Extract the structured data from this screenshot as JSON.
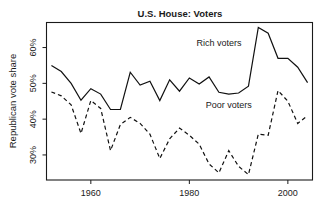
{
  "chart_data": {
    "type": "line",
    "title": "U.S. House: Voters",
    "xlabel": "",
    "ylabel": "Republican vote share",
    "xlim": [
      1951,
      2005
    ],
    "ylim": [
      23,
      67
    ],
    "grid": false,
    "legend_position": "inline-annotations",
    "xticks": [
      1960,
      1980,
      2000
    ],
    "xtick_labels": [
      "1960",
      "1980",
      "2000"
    ],
    "yticks": [
      30,
      40,
      50,
      60
    ],
    "ytick_labels": [
      "30%",
      "40%",
      "50%",
      "60%"
    ],
    "annotations": [
      {
        "text": "Rich voters",
        "x": 1986,
        "y": 60.5
      },
      {
        "text": "Poor voters",
        "x": 1988,
        "y": 43.0
      }
    ],
    "series": [
      {
        "name": "Rich voters",
        "style": "solid",
        "color": "#111111",
        "x": [
          1952,
          1954,
          1956,
          1958,
          1960,
          1962,
          1964,
          1966,
          1968,
          1970,
          1972,
          1974,
          1976,
          1978,
          1980,
          1982,
          1984,
          1986,
          1988,
          1990,
          1992,
          1994,
          1996,
          1998,
          2000,
          2002,
          2004
        ],
        "values": [
          55.0,
          53.3,
          50.0,
          45.3,
          48.5,
          47.0,
          42.7,
          42.7,
          53.1,
          49.5,
          50.6,
          45.2,
          51.0,
          47.8,
          51.5,
          49.8,
          51.8,
          47.5,
          47.0,
          47.3,
          49.2,
          65.6,
          64.0,
          57.0,
          57.0,
          54.5,
          50.2
        ]
      },
      {
        "name": "Poor voters",
        "style": "dashed",
        "color": "#111111",
        "x": [
          1952,
          1954,
          1956,
          1958,
          1960,
          1962,
          1964,
          1966,
          1968,
          1970,
          1972,
          1974,
          1976,
          1978,
          1980,
          1982,
          1984,
          1986,
          1988,
          1990,
          1992,
          1994,
          1996,
          1998,
          2000,
          2002,
          2004
        ],
        "values": [
          47.6,
          46.5,
          44.0,
          36.0,
          45.2,
          43.0,
          31.2,
          38.5,
          40.5,
          38.8,
          35.8,
          29.0,
          34.5,
          37.5,
          35.5,
          33.0,
          27.5,
          25.0,
          31.2,
          26.8,
          24.5,
          35.8,
          35.5,
          48.0,
          45.0,
          38.8,
          41.0
        ]
      }
    ]
  }
}
